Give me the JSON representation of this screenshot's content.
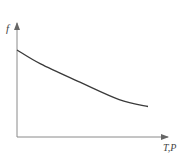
{
  "chart_data": {
    "type": "line",
    "title": "",
    "xlabel": "T,P",
    "ylabel": "f",
    "grid": false,
    "legend": null,
    "ticks": {
      "x": [],
      "y": []
    },
    "series": [
      {
        "name": "f",
        "description": "monotonically decreasing convex curve (qualitative)",
        "x": [
          0.0,
          0.18,
          0.48,
          0.78,
          1.0
        ],
        "y": [
          1.0,
          0.84,
          0.63,
          0.43,
          0.35
        ]
      }
    ],
    "xlim": [
      0,
      1.15
    ],
    "ylim": [
      0,
      1.3
    ]
  },
  "colors": {
    "axis": "#8a8a8a",
    "curve": "#3a3a3a",
    "label": "#444444"
  }
}
